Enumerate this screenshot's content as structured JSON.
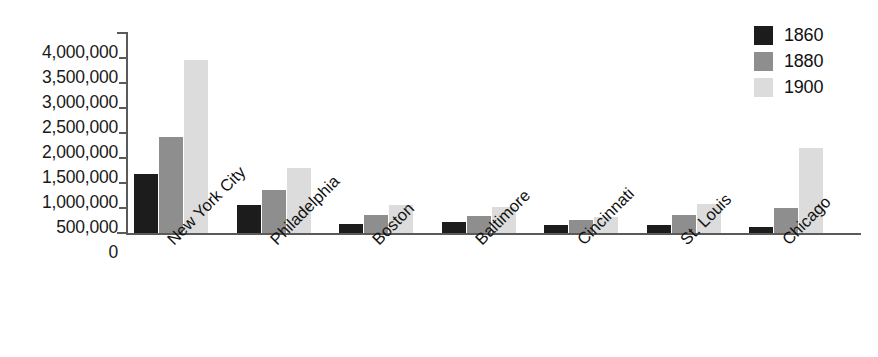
{
  "chart_data": {
    "type": "bar",
    "title": "",
    "subtitle": "",
    "xlabel": "",
    "ylabel": "",
    "categories": [
      "New York City",
      "Philadelphia",
      "Boston",
      "Baltimore",
      "Cincinnati",
      "St. Louis",
      "Chicago"
    ],
    "series": [
      {
        "name": "1860",
        "color": "#1c1c1c",
        "values": [
          1174779,
          565529,
          177840,
          212418,
          161044,
          160773,
          112172
        ]
      },
      {
        "name": "1880",
        "color": "#8e8e8e",
        "values": [
          1911698,
          847170,
          362839,
          332313,
          255139,
          350518,
          503185
        ]
      },
      {
        "name": "1900",
        "color": "#dcdcdc",
        "values": [
          3437202,
          1293697,
          560892,
          508957,
          325902,
          575238,
          1698575
        ]
      }
    ],
    "ylim": [
      0,
      4000000
    ],
    "ytick_values": [
      0,
      500000,
      1000000,
      1500000,
      2000000,
      2500000,
      3000000,
      3500000,
      4000000
    ],
    "ytick_labels": [
      "0",
      "500,000",
      "1,000,000",
      "1,500,000",
      "2,000,000",
      "2,500,000",
      "3,000,000",
      "3,500,000",
      "4,000,000"
    ],
    "grid": false,
    "legend_position": "top-right",
    "legend_entries": [
      "1860",
      "1880",
      "1900"
    ],
    "xtick_rotation_degrees": -45,
    "annotations": []
  },
  "legend": {
    "items": [
      {
        "label": "1860",
        "swatch": "black-swatch-icon"
      },
      {
        "label": "1880",
        "swatch": "gray-swatch-icon"
      },
      {
        "label": "1900",
        "swatch": "light-gray-swatch-icon"
      }
    ]
  }
}
